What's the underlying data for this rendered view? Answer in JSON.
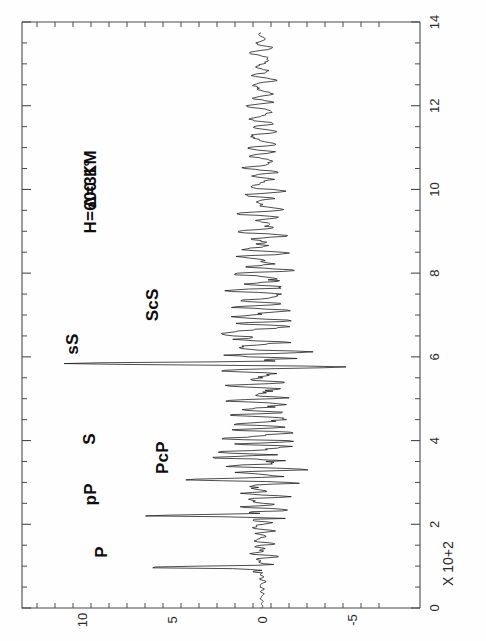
{
  "figure": {
    "kind": "seismogram",
    "background_color": "#fefefe",
    "trace_color": "#1a1a1a",
    "axis_color": "#4a4a4a",
    "rotation_note": "rotated 90 degrees: time axis vertical, amplitude horizontal"
  },
  "annotations": {
    "distance": "Δ=31°",
    "depth": "H=600 KM"
  },
  "axis_title": {
    "time_units": "X 10+2"
  },
  "phase_labels": [
    {
      "name": "P",
      "label": "P",
      "time": 0.95
    },
    {
      "name": "pP",
      "label": "pP",
      "time": 2.2
    },
    {
      "name": "PcP",
      "label": "PcP",
      "time": 3.1
    },
    {
      "name": "S",
      "label": "S",
      "time": 3.65
    },
    {
      "name": "sS",
      "label": "sS",
      "time": 5.85
    },
    {
      "name": "ScS",
      "label": "ScS",
      "time": 6.5
    }
  ],
  "chart_data": {
    "type": "line",
    "title": "",
    "subtitle": "",
    "xlabel": "X 10+2",
    "ylabel": "",
    "orientation": "time-vertical-amplitude-horizontal",
    "time_axis": {
      "label": "X 10+2",
      "min": 0,
      "max": 14,
      "major_ticks": [
        0,
        2,
        4,
        6,
        8,
        10,
        12,
        14
      ],
      "major_tick_labels": [
        "0",
        "2",
        "4",
        "6",
        "8",
        "10",
        "12",
        "14"
      ],
      "minor_tick_step": 0.5,
      "grid": false,
      "position": "right"
    },
    "amplitude_axis": {
      "label": "",
      "min": -7,
      "max": 12.5,
      "major_ticks": [
        10,
        5,
        0,
        -5
      ],
      "major_tick_labels": [
        "10",
        "5",
        "0",
        "-5"
      ],
      "minor_tick_step": 1,
      "grid": false,
      "position": "bottom",
      "direction": "positive-left"
    },
    "legend": {
      "show": false,
      "position": "none"
    },
    "annotations": [
      {
        "text": "Δ=31°",
        "time": 9.55,
        "amplitude": 9.2
      },
      {
        "text": "H=600 KM",
        "time": 8.95,
        "amplitude": 9.2
      },
      {
        "text": "P",
        "time": 1.2,
        "amplitude": 8.6
      },
      {
        "text": "pP",
        "time": 2.45,
        "amplitude": 9.2
      },
      {
        "text": "PcP",
        "time": 3.2,
        "amplitude": 5.2
      },
      {
        "text": "S",
        "time": 3.9,
        "amplitude": 9.3
      },
      {
        "text": "sS",
        "time": 6.05,
        "amplitude": 10.2
      },
      {
        "text": "ScS",
        "time": 6.85,
        "amplitude": 5.8
      }
    ],
    "series": [
      {
        "name": "synthetic-seismogram",
        "color": "#1a1a1a",
        "description": "Synthetic long-period seismogram, delta=31 deg, source depth 600 km. Impulsive arrivals at P, pP, PcP, S, sS, ScS with surface-wave/coda train after 6.5.",
        "sampling_interval": 0.02,
        "time_start": 0,
        "time_end": 13.75,
        "envelope": [
          {
            "t": 0.0,
            "a": 0.0
          },
          {
            "t": 0.5,
            "a": 0.05
          },
          {
            "t": 0.8,
            "a": 0.18
          },
          {
            "t": 0.95,
            "a": 6.6
          },
          {
            "t": 1.05,
            "a": 1.4
          },
          {
            "t": 1.4,
            "a": 1.1
          },
          {
            "t": 1.8,
            "a": 0.9
          },
          {
            "t": 2.1,
            "a": 1.3
          },
          {
            "t": 2.2,
            "a": 7.4
          },
          {
            "t": 2.35,
            "a": 2.2
          },
          {
            "t": 2.7,
            "a": 1.9
          },
          {
            "t": 3.0,
            "a": 2.6
          },
          {
            "t": 3.1,
            "a": 5.1
          },
          {
            "t": 3.35,
            "a": 3.1
          },
          {
            "t": 3.55,
            "a": 4.2
          },
          {
            "t": 3.65,
            "a": 8.1
          },
          {
            "t": 3.85,
            "a": 3.8
          },
          {
            "t": 4.2,
            "a": 3.4
          },
          {
            "t": 4.6,
            "a": 2.9
          },
          {
            "t": 5.0,
            "a": 2.6
          },
          {
            "t": 5.4,
            "a": 2.4
          },
          {
            "t": 5.7,
            "a": 2.9
          },
          {
            "t": 5.85,
            "a": 11.3
          },
          {
            "t": 6.0,
            "a": 3.2
          },
          {
            "t": 6.4,
            "a": 3.4
          },
          {
            "t": 6.6,
            "a": 3.6
          },
          {
            "t": 7.0,
            "a": 3.1
          },
          {
            "t": 7.5,
            "a": 2.7
          },
          {
            "t": 8.0,
            "a": 2.5
          },
          {
            "t": 8.5,
            "a": 2.2
          },
          {
            "t": 9.0,
            "a": 1.9
          },
          {
            "t": 9.5,
            "a": 1.7
          },
          {
            "t": 10.0,
            "a": 1.55
          },
          {
            "t": 10.5,
            "a": 1.45
          },
          {
            "t": 11.0,
            "a": 1.35
          },
          {
            "t": 11.5,
            "a": 1.3
          },
          {
            "t": 12.0,
            "a": 1.2
          },
          {
            "t": 12.5,
            "a": 1.1
          },
          {
            "t": 13.0,
            "a": 1.0
          },
          {
            "t": 13.4,
            "a": 0.85
          },
          {
            "t": 13.75,
            "a": 0.4
          }
        ],
        "impulses": [
          {
            "t": 0.95,
            "a": -6.6,
            "phase": "P"
          },
          {
            "t": 2.2,
            "a": -7.4,
            "phase": "pP"
          },
          {
            "t": 2.22,
            "a": 4.3,
            "phase": "pP-trough"
          },
          {
            "t": 3.1,
            "a": -5.1,
            "phase": "PcP"
          },
          {
            "t": 3.12,
            "a": 3.6,
            "phase": "PcP-trough"
          },
          {
            "t": 3.65,
            "a": -8.1,
            "phase": "S"
          },
          {
            "t": 3.68,
            "a": 4.6,
            "phase": "S-trough"
          },
          {
            "t": 5.85,
            "a": -11.3,
            "phase": "sS"
          },
          {
            "t": 5.88,
            "a": 4.9,
            "phase": "sS-trough"
          },
          {
            "t": 6.5,
            "a": -3.9,
            "phase": "ScS"
          }
        ]
      }
    ]
  }
}
